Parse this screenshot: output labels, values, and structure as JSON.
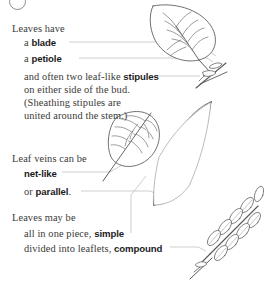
{
  "diagram": {
    "background_color": "#ffffff",
    "text_color": "#3a3a38",
    "ink_color": "#4a4a4a",
    "leader_color": "#b9b9b9"
  },
  "corner": {
    "mark": "circle-mark"
  },
  "blocks": {
    "block1": {
      "intro": "Leaves have",
      "line_blade_prefix": "a ",
      "line_blade_term": "blade",
      "line_petiole_prefix": "a ",
      "line_petiole_term": "petiole",
      "line_stipules_prefix": "and often two leaf-like ",
      "line_stipules_term": "stipules",
      "line_bud": "on either side of the bud.",
      "line_sheath_1": "(Sheathing stipules are",
      "line_sheath_2": "united around the stem.)"
    },
    "block2": {
      "intro": "Leaf veins can be",
      "term_net": "net-like",
      "parallel_prefix": "or ",
      "parallel_term": "parallel",
      "parallel_suffix": "."
    },
    "block3": {
      "intro": "Leaves may be",
      "simple_prefix": "all in one piece, ",
      "simple_term": "simple",
      "compound_prefix": "divided into leaflets, ",
      "compound_term": "compound"
    }
  },
  "figures": {
    "simple_leaf_with_stipules": "simple-leaf-blade-petiole-stipules-illustration",
    "net_veined_leaf": "net-veined-leaf-illustration",
    "parallel_veined_leaf": "parallel-veined-leaf-illustration",
    "compound_leaf": "pinnately-compound-leaf-illustration"
  },
  "leaders": {
    "blade": "leader-line-blade",
    "petiole": "leader-line-petiole",
    "stipules": "leader-line-stipules",
    "net_like": "leader-line-net-like",
    "parallel": "leader-line-parallel",
    "simple": "leader-line-simple",
    "compound": "leader-line-compound"
  }
}
